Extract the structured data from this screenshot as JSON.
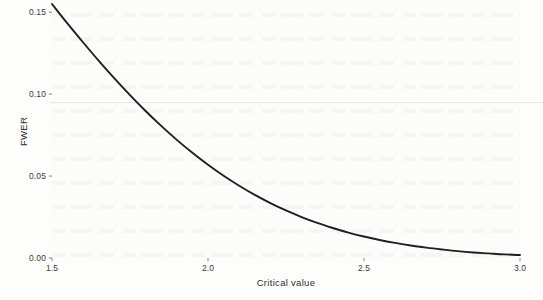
{
  "figure": {
    "background_color": "#fdfdfc",
    "panel_background_color": "#fcfcfb",
    "line_color": "#1f1f1f",
    "text_color": "#3b3b3b",
    "artifact_line_color": "#e6e6e4"
  },
  "chart_data": {
    "type": "line",
    "title": "",
    "subtitle": "",
    "xlabel": "Critical value",
    "ylabel": "FWER",
    "xlim": [
      1.5,
      3.0
    ],
    "ylim": [
      0.0,
      0.155
    ],
    "grid": false,
    "legend": null,
    "xticks": [
      "1.5",
      "2.0",
      "2.5",
      "3.0"
    ],
    "xtick_values": [
      1.5,
      2.0,
      2.5,
      3.0
    ],
    "yticks": [
      "0.00",
      "0.05",
      "0.10",
      "0.15"
    ],
    "ytick_values": [
      0.0,
      0.05,
      0.1,
      0.15
    ],
    "series": [
      {
        "name": "FWER",
        "color": "#1f1f1f",
        "x": [
          1.5,
          1.55,
          1.6,
          1.65,
          1.7,
          1.75,
          1.8,
          1.85,
          1.9,
          1.95,
          2.0,
          2.05,
          2.1,
          2.15,
          2.2,
          2.25,
          2.3,
          2.35,
          2.4,
          2.45,
          2.5,
          2.55,
          2.6,
          2.65,
          2.7,
          2.75,
          2.8,
          2.85,
          2.9,
          2.95,
          3.0
        ],
        "values": [
          0.155,
          0.143,
          0.1315,
          0.1203,
          0.1096,
          0.0994,
          0.0897,
          0.0806,
          0.0721,
          0.0642,
          0.0569,
          0.0502,
          0.0441,
          0.0385,
          0.0335,
          0.029,
          0.025,
          0.0214,
          0.0183,
          0.0155,
          0.0131,
          0.011,
          0.0092,
          0.0076,
          0.0063,
          0.0052,
          0.0042,
          0.0034,
          0.0028,
          0.0022,
          0.0018
        ]
      }
    ],
    "annotations": [
      {
        "name": "scan-artifact-line",
        "type": "horizontal-line",
        "y_value": 0.095,
        "color": "#e6e6e4"
      }
    ]
  }
}
